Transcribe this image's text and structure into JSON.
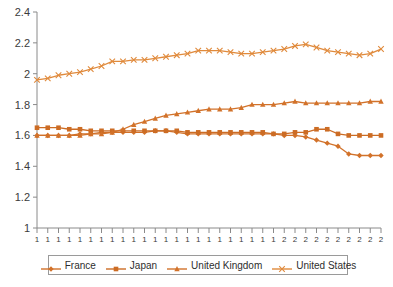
{
  "chart_data": {
    "type": "line",
    "title": "",
    "xlabel": "",
    "ylabel": "",
    "ylim": [
      1,
      2.4
    ],
    "yticks": [
      "1",
      "1.2",
      "1.4",
      "1.6",
      "1.8",
      "2",
      "2.2",
      "2.4"
    ],
    "ytick_values": [
      1,
      1.2,
      1.4,
      1.6,
      1.8,
      2,
      2.2,
      2.4
    ],
    "grid": false,
    "legend_position": "bottom",
    "xtick_labels": [
      "1",
      "1",
      "1",
      "1",
      "1",
      "1",
      "1",
      "1",
      "1",
      "1",
      "1",
      "1",
      "1",
      "1",
      "1",
      "1",
      "1",
      "1",
      "1",
      "1",
      "1",
      "1",
      "1",
      "2",
      "2",
      "2",
      "2",
      "2",
      "2",
      "2",
      "2",
      "2",
      "2"
    ],
    "x": [
      1,
      2,
      3,
      4,
      5,
      6,
      7,
      8,
      9,
      10,
      11,
      12,
      13,
      14,
      15,
      16,
      17,
      18,
      19,
      20,
      21,
      22,
      23,
      24,
      25,
      26,
      27,
      28,
      29,
      30,
      31,
      32,
      33
    ],
    "series": [
      {
        "name": "France",
        "marker": "diamond",
        "color": "#D2722A",
        "values": [
          1.6,
          1.6,
          1.6,
          1.6,
          1.61,
          1.61,
          1.62,
          1.62,
          1.62,
          1.62,
          1.62,
          1.63,
          1.63,
          1.62,
          1.61,
          1.61,
          1.61,
          1.61,
          1.61,
          1.61,
          1.61,
          1.61,
          1.61,
          1.6,
          1.6,
          1.59,
          1.57,
          1.55,
          1.53,
          1.48,
          1.47,
          1.47,
          1.47
        ]
      },
      {
        "name": "Japan",
        "marker": "square",
        "color": "#CC6C24",
        "values": [
          1.65,
          1.65,
          1.65,
          1.64,
          1.64,
          1.63,
          1.63,
          1.63,
          1.63,
          1.63,
          1.63,
          1.63,
          1.63,
          1.63,
          1.62,
          1.62,
          1.62,
          1.62,
          1.62,
          1.62,
          1.62,
          1.62,
          1.61,
          1.61,
          1.62,
          1.62,
          1.64,
          1.64,
          1.61,
          1.6,
          1.6,
          1.6,
          1.6
        ]
      },
      {
        "name": "United Kingdom",
        "marker": "triangle",
        "color": "#D2722A",
        "values": [
          1.6,
          1.6,
          1.6,
          1.6,
          1.6,
          1.61,
          1.61,
          1.62,
          1.64,
          1.67,
          1.69,
          1.71,
          1.73,
          1.74,
          1.75,
          1.76,
          1.77,
          1.77,
          1.77,
          1.78,
          1.8,
          1.8,
          1.8,
          1.81,
          1.82,
          1.81,
          1.81,
          1.81,
          1.81,
          1.81,
          1.81,
          1.82,
          1.82
        ]
      },
      {
        "name": "United States",
        "marker": "cross",
        "color": "#E08A3C",
        "values": [
          1.96,
          1.97,
          1.99,
          2.0,
          2.01,
          2.03,
          2.05,
          2.08,
          2.08,
          2.09,
          2.09,
          2.1,
          2.11,
          2.12,
          2.13,
          2.15,
          2.15,
          2.15,
          2.14,
          2.13,
          2.13,
          2.14,
          2.15,
          2.16,
          2.18,
          2.19,
          2.17,
          2.15,
          2.14,
          2.13,
          2.12,
          2.13,
          2.16
        ]
      }
    ]
  },
  "legend": {
    "entries": [
      {
        "label": "France"
      },
      {
        "label": "Japan"
      },
      {
        "label": "United Kingdom"
      },
      {
        "label": "United States"
      }
    ]
  }
}
